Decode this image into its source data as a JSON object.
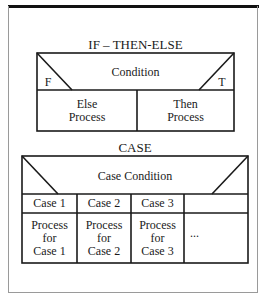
{
  "if_then_else": {
    "title": "IF – THEN-ELSE",
    "condition": "Condition",
    "false_label": "F",
    "true_label": "T",
    "else_process_line1": "Else",
    "else_process_line2": "Process",
    "then_process_line1": "Then",
    "then_process_line2": "Process"
  },
  "case": {
    "title": "CASE",
    "condition": "Case Condition",
    "cases": [
      {
        "label": "Case 1",
        "process_line1": "Process",
        "process_line2": "for",
        "process_line3": "Case 1"
      },
      {
        "label": "Case 2",
        "process_line1": "Process",
        "process_line2": "for",
        "process_line3": "Case 2"
      },
      {
        "label": "Case 3",
        "process_line1": "Process",
        "process_line2": "for",
        "process_line3": "Case 3"
      },
      {
        "label": "",
        "process_line1": "...",
        "process_line2": "",
        "process_line3": ""
      }
    ]
  }
}
